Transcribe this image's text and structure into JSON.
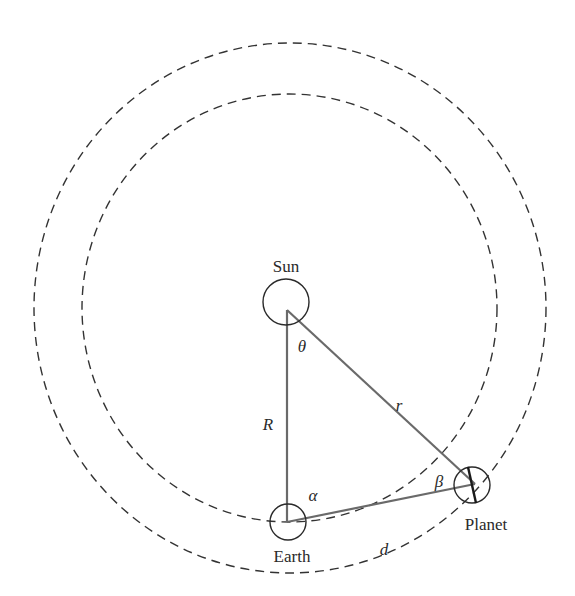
{
  "diagram": {
    "bodies": {
      "sun": "Sun",
      "earth": "Earth",
      "planet": "Planet"
    },
    "sides": {
      "sun_earth": "R",
      "sun_planet": "r",
      "earth_planet": "d"
    },
    "angles": {
      "at_sun": "θ",
      "at_earth": "α",
      "at_planet": "β"
    },
    "colors": {
      "orbit": "#333333",
      "triangle": "#6a6a6a",
      "body_outline": "#2a2a2a"
    }
  }
}
